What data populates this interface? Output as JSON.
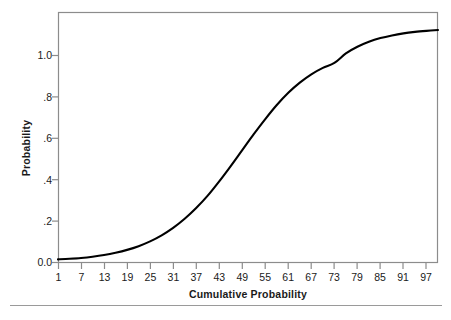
{
  "chart_data": {
    "type": "line",
    "title": "",
    "subtitle": "",
    "xlabel": "Cumulative Probability",
    "ylabel": "Probability",
    "xlim": [
      1,
      100
    ],
    "ylim": [
      0.0,
      1.17
    ],
    "xticks": [
      1,
      7,
      13,
      19,
      25,
      31,
      37,
      43,
      49,
      55,
      61,
      67,
      73,
      79,
      85,
      91,
      97
    ],
    "xtick_labels": [
      "1",
      "7",
      "13",
      "19",
      "25",
      "31",
      "37",
      "43",
      "49",
      "55",
      "61",
      "67",
      "73",
      "79",
      "85",
      "91",
      "97"
    ],
    "yticks": [
      0.0,
      0.2,
      0.4,
      0.6,
      0.8,
      1.0
    ],
    "ytick_labels": [
      "0.0",
      ".2",
      ".4",
      ".6",
      ".8",
      "1.0"
    ],
    "grid": false,
    "legend": false,
    "legend_position": "none",
    "line_color": "#000000",
    "frame_color": "#8c8c8c",
    "series": [
      {
        "name": "Cumulative probability curve",
        "x": [
          1,
          4,
          7,
          10,
          13,
          16,
          19,
          22,
          25,
          28,
          31,
          34,
          37,
          40,
          43,
          46,
          49,
          52,
          55,
          58,
          61,
          64,
          67,
          70,
          73,
          76,
          79,
          82,
          85,
          88,
          91,
          94,
          97,
          100
        ],
        "values": [
          0.015,
          0.018,
          0.022,
          0.028,
          0.036,
          0.047,
          0.061,
          0.079,
          0.102,
          0.131,
          0.167,
          0.211,
          0.263,
          0.323,
          0.392,
          0.466,
          0.543,
          0.62,
          0.693,
          0.761,
          0.82,
          0.869,
          0.909,
          0.94,
          0.964,
          0.101,
          0.1042,
          0.1066,
          0.1084,
          0.1097,
          0.1107,
          0.1114,
          0.1119,
          0.1123
        ]
      }
    ],
    "curve_points_px": "M58,259 C80,258 100,254 118,246 C140,236 158,222 176,204 C196,184 214,160 232,136 C252,110 272,86 292,68 C312,50 334,38 356,32 C378,27 404,26 438,26"
  },
  "axes": {
    "y_title": "Probability",
    "x_title": "Cumulative Probability"
  }
}
